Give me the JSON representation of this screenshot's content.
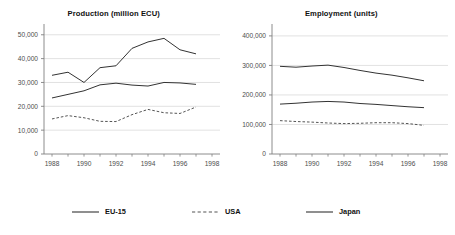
{
  "figure": {
    "background": "#ffffff",
    "axis_color": "#808080",
    "grid_color": "#d9d9d9",
    "series_color": "#333333"
  },
  "legend": {
    "position": "bottom",
    "entries": [
      {
        "label": "EU-15",
        "style": "solid",
        "color": "#333333",
        "name": "legend-eu15"
      },
      {
        "label": "USA",
        "style": "dashed",
        "color": "#555555",
        "name": "legend-usa"
      },
      {
        "label": "Japan",
        "style": "solid",
        "color": "#333333",
        "name": "legend-japan"
      }
    ]
  },
  "chart_data": [
    {
      "type": "line",
      "id": "production",
      "title": "Production (million ECU)",
      "xlabel": "",
      "ylabel": "",
      "x": [
        1988,
        1989,
        1990,
        1991,
        1992,
        1993,
        1994,
        1995,
        1996,
        1997
      ],
      "xticks": [
        1988,
        1990,
        1992,
        1994,
        1996,
        1998
      ],
      "xticklabels": [
        "1988",
        "1990",
        "1992",
        "1994",
        "1996",
        "1998"
      ],
      "xlim": [
        1987.5,
        1998.5
      ],
      "yticks": [
        0,
        10000,
        20000,
        30000,
        40000,
        50000
      ],
      "yticklabels": [
        "0",
        "10,000",
        "20,000",
        "30,000",
        "40,000",
        "50,000"
      ],
      "ylim": [
        0,
        52000
      ],
      "grid": true,
      "grid_axis": "y",
      "series": [
        {
          "name": "Japan",
          "style": "solid",
          "color": "#333333",
          "values": [
            33000,
            34300,
            30000,
            36200,
            37000,
            44300,
            47000,
            48500,
            43700,
            42000
          ]
        },
        {
          "name": "EU-15",
          "style": "solid",
          "color": "#333333",
          "values": [
            23500,
            25000,
            26500,
            29000,
            29700,
            28900,
            28500,
            30000,
            29800,
            29200
          ]
        },
        {
          "name": "USA",
          "style": "dashed",
          "color": "#555555",
          "values": [
            14700,
            16100,
            15200,
            13700,
            13600,
            16500,
            18700,
            17300,
            17000,
            19700
          ]
        }
      ]
    },
    {
      "type": "line",
      "id": "employment",
      "title": "Employment (units)",
      "xlabel": "",
      "ylabel": "",
      "x": [
        1988,
        1989,
        1990,
        1991,
        1992,
        1993,
        1994,
        1995,
        1996,
        1997
      ],
      "xticks": [
        1988,
        1990,
        1992,
        1994,
        1996,
        1998
      ],
      "xticklabels": [
        "1988",
        "1990",
        "1992",
        "1994",
        "1996",
        "1998"
      ],
      "xlim": [
        1987.5,
        1998.5
      ],
      "yticks": [
        0,
        100000,
        200000,
        300000,
        400000
      ],
      "yticklabels": [
        "0",
        "100,000",
        "200,000",
        "300,000",
        "400,000"
      ],
      "ylim": [
        0,
        420000
      ],
      "grid": true,
      "grid_axis": "y",
      "series": [
        {
          "name": "Japan",
          "style": "solid",
          "color": "#333333",
          "values": [
            297000,
            294000,
            298000,
            301000,
            293000,
            283000,
            274000,
            267000,
            258000,
            248000
          ]
        },
        {
          "name": "EU-15",
          "style": "solid",
          "color": "#333333",
          "values": [
            169000,
            172000,
            176000,
            178000,
            176000,
            171000,
            168000,
            164000,
            160000,
            157000
          ]
        },
        {
          "name": "USA",
          "style": "dashed",
          "color": "#555555",
          "values": [
            113000,
            110000,
            108000,
            105000,
            103000,
            104000,
            106000,
            106000,
            103000,
            97000
          ]
        }
      ]
    }
  ]
}
